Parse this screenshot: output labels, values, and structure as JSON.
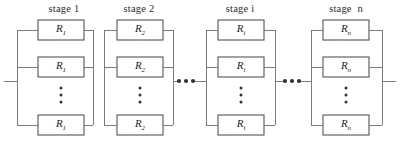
{
  "diagram": {
    "type": "reliability-block-diagram",
    "line_color": "#6e6e6e",
    "box_border_color": "#555555",
    "box_fill_color": "#ffffff",
    "text_color": "#1d1d1d",
    "background_color": "#ffffff",
    "stage_count_visible": 4,
    "stages": [
      {
        "id": "stage-1",
        "label": "stage 1",
        "label_x": 36,
        "label_y": 3,
        "label_width": 56,
        "group_left": 17,
        "group_right": 93,
        "box_left": 38,
        "box_width": 46,
        "blocks": [
          {
            "symbol": "R",
            "subscript": "1",
            "y": 20,
            "height": 20
          },
          {
            "symbol": "R",
            "subscript": "1",
            "y": 57,
            "height": 20
          },
          {
            "symbol": "R",
            "subscript": "1",
            "y": 115,
            "height": 20
          }
        ],
        "vdots": {
          "x": 61,
          "ys": [
            88,
            95,
            102
          ]
        }
      },
      {
        "id": "stage-2",
        "label": "stage 2",
        "label_x": 111,
        "label_y": 3,
        "label_width": 56,
        "group_left": 104,
        "group_right": 173,
        "box_left": 117,
        "box_width": 46,
        "blocks": [
          {
            "symbol": "R",
            "subscript": "2",
            "y": 20,
            "height": 20
          },
          {
            "symbol": "R",
            "subscript": "2",
            "y": 57,
            "height": 20
          },
          {
            "symbol": "R",
            "subscript": "2",
            "y": 115,
            "height": 20
          }
        ],
        "vdots": {
          "x": 140,
          "ys": [
            88,
            95,
            102
          ]
        }
      },
      {
        "id": "stage-i",
        "label": "stage i",
        "label_x": 212,
        "label_y": 3,
        "label_width": 56,
        "group_left": 206,
        "group_right": 275,
        "box_left": 218,
        "box_width": 46,
        "blocks": [
          {
            "symbol": "R",
            "subscript": "i",
            "y": 20,
            "height": 20
          },
          {
            "symbol": "R",
            "subscript": "i",
            "y": 57,
            "height": 20
          },
          {
            "symbol": "R",
            "subscript": "i",
            "y": 115,
            "height": 20
          }
        ],
        "vdots": {
          "x": 241,
          "ys": [
            88,
            95,
            102
          ]
        }
      },
      {
        "id": "stage-n",
        "label": "stage  n",
        "label_x": 316,
        "label_y": 3,
        "label_width": 60,
        "group_left": 311,
        "group_right": 382,
        "box_left": 323,
        "box_width": 46,
        "blocks": [
          {
            "symbol": "R",
            "subscript": "n",
            "y": 20,
            "height": 20
          },
          {
            "symbol": "R",
            "subscript": "n",
            "y": 57,
            "height": 20
          },
          {
            "symbol": "R",
            "subscript": "n",
            "y": 115,
            "height": 20
          }
        ],
        "vdots": {
          "x": 346,
          "ys": [
            88,
            95,
            102
          ]
        }
      }
    ],
    "horizontal_ellipses": [
      {
        "id": "ellipsis-between-2-and-i",
        "xs": [
          179,
          186,
          193
        ],
        "y": 81
      },
      {
        "id": "ellipsis-between-i-and-n",
        "xs": [
          285,
          292,
          299
        ],
        "y": 81
      }
    ],
    "main_line_y": 81,
    "lead_in": {
      "x1": 4,
      "x2": 17
    },
    "lead_out": {
      "x1": 382,
      "x2": 396
    },
    "connector_segments": [
      {
        "from": "stage-2-right",
        "x1": 173,
        "x2": 179
      },
      {
        "from": "ellipsis-1-right",
        "x1": 193,
        "x2": 206
      },
      {
        "from": "stage-i-right",
        "x1": 275,
        "x2": 285
      },
      {
        "from": "ellipsis-2-right",
        "x1": 299,
        "x2": 311
      }
    ]
  }
}
